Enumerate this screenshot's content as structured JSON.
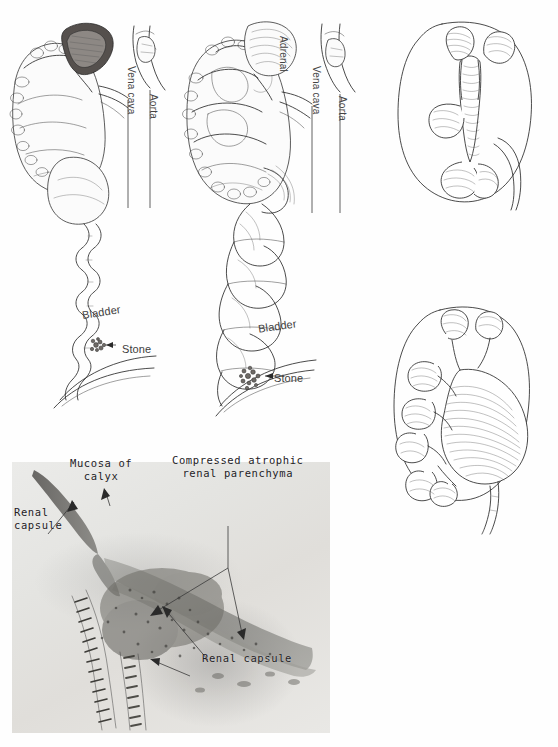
{
  "page": {
    "background_color": "#fefefe",
    "ink_color": "#2b2b2b"
  },
  "figures": {
    "gross_left": {
      "name": "Kidney with tortuous ureter and bladder stone",
      "labels": {
        "vena_cava": "Vena cava",
        "aorta": "Aorta",
        "bladder": "Bladder",
        "stone": "Stone"
      }
    },
    "gross_right": {
      "name": "Hydronephrotic kidney with markedly dilated ureter and bladder stone",
      "labels": {
        "adrenal": "Adrenal",
        "vena_cava": "Vena cava",
        "aorta": "Aorta",
        "bladder": "Bladder",
        "stone": "Stone"
      }
    },
    "kidney_normal": {
      "name": "Cast of normal pelvicalyceal system within kidney outline",
      "labels": {}
    },
    "kidney_hydro": {
      "name": "Cast of dilated pelvis and blunted calyces in hydronephrosis",
      "labels": {}
    },
    "histology": {
      "name": "Photomicrograph of hydronephrotic kidney wall",
      "labels": {
        "mucosa_of_calyx": "Mucosa of\ncalyx",
        "renal_capsule_upper": "Renal\ncapsule",
        "compressed_parenchyma": "Compressed atrophic\nrenal parenchyma",
        "renal_capsule_lower": "Renal capsule"
      }
    }
  }
}
